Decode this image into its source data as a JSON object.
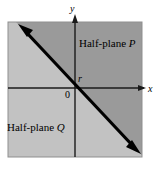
{
  "figure": {
    "canvas": {
      "width": 158,
      "height": 172,
      "background": "#ffffff"
    },
    "shaded_square": {
      "x": 8,
      "y": 22,
      "width": 134,
      "height": 135,
      "fill_upper_right": "#9a9a9a",
      "fill_lower_left": "#c2c2c2",
      "border_color": "#8f8f8f"
    },
    "axes": {
      "origin": {
        "x": 75,
        "y": 88
      },
      "color": "#1a1a1a",
      "x_axis": {
        "label": "x",
        "from_x": 8,
        "to_x": 146,
        "y": 88
      },
      "y_axis": {
        "label": "y",
        "x": 75,
        "from_y": 157,
        "to_y": 16
      }
    },
    "line": {
      "color": "#000000",
      "width": 3,
      "from": {
        "x": 20,
        "y": 26
      },
      "to": {
        "x": 139,
        "y": 152
      },
      "arrowheads": "both",
      "slope_description": "negative slope, approximately -1"
    },
    "labels": {
      "half_plane_p": "Half-plane P",
      "half_plane_p_name": "Half-plane",
      "half_plane_p_letter": "P",
      "half_plane_q": "Half-plane Q",
      "half_plane_q_name": "Half-plane",
      "half_plane_q_letter": "Q",
      "origin": "0",
      "point_r": "r",
      "axis_x": "x",
      "axis_y": "y"
    }
  }
}
